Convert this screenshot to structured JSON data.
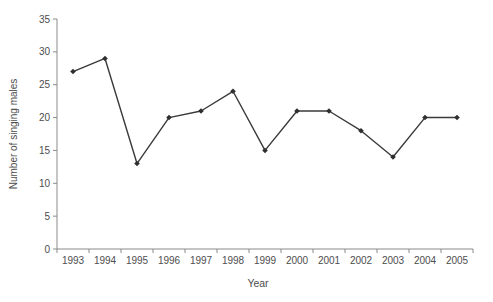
{
  "chart_data": {
    "type": "line",
    "title": "",
    "xlabel": "Year",
    "ylabel": "Number of singing males",
    "categories": [
      "1993",
      "1994",
      "1995",
      "1996",
      "1997",
      "1998",
      "1999",
      "2000",
      "2001",
      "2002",
      "2003",
      "2004",
      "2005"
    ],
    "series": [
      {
        "name": "singing-males",
        "values": [
          27,
          29,
          13,
          20,
          21,
          24,
          15,
          21,
          21,
          18,
          14,
          20,
          20
        ]
      }
    ],
    "ylim": [
      0,
      35
    ],
    "yticks": [
      0,
      5,
      10,
      15,
      20,
      25,
      30,
      35
    ],
    "grid": false,
    "legend": "none",
    "marker": "diamond",
    "colors": {
      "line": "#3a3a3a",
      "marker": "#2f2f2f",
      "axis": "#8a8a8a",
      "tick_text": "#4d4d4d",
      "axis_title_text": "#4d4d4d",
      "background": "#ffffff"
    }
  }
}
